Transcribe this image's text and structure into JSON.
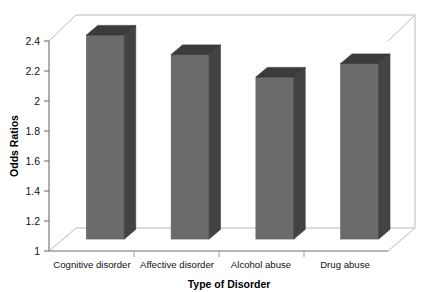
{
  "chart_data": {
    "type": "bar",
    "title": "",
    "subtitle": "",
    "xlabel": "Type of Disorder",
    "ylabel": "Odds Ratios",
    "categories": [
      "Cognitive disorder",
      "Affective disorder",
      "Alcohol abuse",
      "Drug abuse"
    ],
    "values": [
      2.36,
      2.23,
      2.08,
      2.17
    ],
    "series": [
      {
        "name": "Odds Ratios",
        "values": [
          2.36,
          2.23,
          2.08,
          2.17
        ]
      }
    ],
    "ylim": [
      1,
      2.4
    ],
    "yticks": [
      1,
      1.2,
      1.4,
      1.6,
      1.8,
      2,
      2.2,
      2.4
    ],
    "ytick_labels": [
      "1",
      "1.2",
      "1.4",
      "1.6",
      "1.8",
      "2",
      "2.2",
      "2.4"
    ],
    "grid": false,
    "legend": false,
    "legend_position": "none",
    "three_d": true,
    "annotations": [],
    "colors": {
      "bar_front": "#6b6b6b",
      "bar_side": "#434343",
      "bar_top": "#3b3b3b",
      "axis": "#6f6f6f",
      "frame": "#b9b9b9",
      "text": "#111111",
      "background": "#ffffff"
    }
  },
  "axis": {
    "y_title": "Odds Ratios",
    "x_title": "Type of Disorder",
    "y_tick_0": "1",
    "y_tick_1": "1.2",
    "y_tick_2": "1.4",
    "y_tick_3": "1.6",
    "y_tick_4": "1.8",
    "y_tick_5": "2",
    "y_tick_6": "2.2",
    "y_tick_7": "2.4"
  },
  "categories": {
    "c0": "Cognitive disorder",
    "c1": "Affective disorder",
    "c2": "Alcohol abuse",
    "c3": "Drug abuse"
  }
}
